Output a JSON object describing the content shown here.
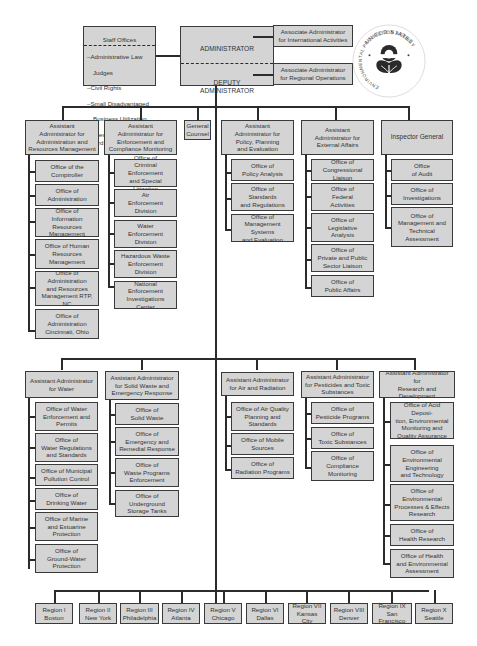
{
  "top": {
    "staff_offices": {
      "title": "Staff Offices",
      "items": [
        "–Administrative Law",
        "Judges",
        "–Civil Rights",
        "–Small Disadvantaged",
        "Business Utilization",
        "–Science Advisory Board"
      ]
    },
    "administrator": "ADMINISTRATOR",
    "deputy_administrator": "DEPUTY\nADMINISTRATOR",
    "assoc_international": "Associate Administrator\nfor International Activities",
    "assoc_regional": "Associate Administrator\nfor Regional Operations",
    "seal": {
      "top_text": "UNITED STATES",
      "side_text": "ENVIRONMENTAL PROTECTION AGENCY"
    }
  },
  "row1": {
    "arm": {
      "head": "Assistant\nAdministrator for\nAdministration and\nResources Management",
      "offices": [
        "Office of the\nComptroller",
        "Office of\nAdministration",
        "Office of\nInformation Resources\nManagement",
        "Office of Human\nResources\nManagement",
        "Office of\nAdministration\nand Resources\nManagement RTP, NC",
        "Office of\nAdministration\nCincinnati, Ohio"
      ]
    },
    "ecm": {
      "head": "Assistant\nAdministrator for\nEnforcement and\nCompliance Monitoring",
      "offices": [
        "Office of\nCriminal Enforcement\nand Special Litigation",
        "Air\nEnforcement\nDivision",
        "Water\nEnforcement\nDivision",
        "Hazardous Waste\nEnforcement\nDivision",
        "National\nEnforcement\nInvestigations Center"
      ]
    },
    "general_counsel": "General\nCounsel",
    "ppe": {
      "head": "Assistant\nAdministrator for\nPolicy, Planning\nand Evaluation",
      "offices": [
        "Office of\nPolicy Analysis",
        "Office of\nStandards\nand Regulations",
        "Office of\nManagement Systems\nand Evaluation"
      ]
    },
    "ea": {
      "head": "Assistant\nAdministrator for\nExternal Affairs",
      "offices": [
        "Office of\nCongressional Liaison",
        "Office of\nFederal\nActivities",
        "Office of\nLegislative\nAnalysis",
        "Office of\nPrivate and Public\nSector Liaison",
        "Office of\nPublic Affairs"
      ]
    },
    "ig": {
      "head": "Inspector General",
      "offices": [
        "Office\nof Audit",
        "Office of\nInvestigations",
        "Office of\nManagement and\nTechnical\nAssessment"
      ]
    }
  },
  "row2": {
    "water": {
      "head": "Assistant Administrator\nfor Water",
      "offices": [
        "Office of Water\nEnforcement and\nPermits",
        "Office of\nWater Regulations\nand Standards",
        "Office of Municipal\nPollution Control",
        "Office of\nDrinking Water",
        "Office of Marine\nand Estuarine\nProtection",
        "Office of\nGround-Water\nProtection"
      ]
    },
    "swer": {
      "head": "Assistant Administrator\nfor Solid Waste and\nEmergency Response",
      "offices": [
        "Office of\nSolid Waste",
        "Office of\nEmergency and\nRemedial Response",
        "Office of\nWaste Programs\nEnforcement",
        "Office of\nUnderground\nStorage Tanks"
      ]
    },
    "air": {
      "head": "Assistant Administrator\nfor Air and Radiation",
      "offices": [
        "Office of Air Quality\nPlanning and\nStandards",
        "Office of Mobile\nSources",
        "Office of\nRadiation Programs"
      ]
    },
    "pts": {
      "head": "Assistant Administrator\nfor Pesticides and Toxic\nSubstances",
      "offices": [
        "Office of\nPesticide Programs",
        "Office of\nToxic Substances",
        "Office of\nCompliance\nMonitoring"
      ]
    },
    "rd": {
      "head": "Assistant Administrator\nfor\nResearch and Development",
      "offices": [
        "Office of Acid Deposi-\ntion, Environmental\nMonitoring and\nQuality Assurance",
        "Office of\nEnvironmental\nEngineering\nand Technology",
        "Office of\nEnvironmental\nProcesses & Effects\nResearch",
        "Office of\nHealth Research",
        "Office of Health\nand Environmental\nAssessment"
      ]
    }
  },
  "regions": [
    "Region I\nBoston",
    "Region II\nNew York",
    "Region III\nPhiladelphia",
    "Region IV\nAtlanta",
    "Region V\nChicago",
    "Region VI\nDallas",
    "Region VII\nKansas City",
    "Region VIII\nDenver",
    "Region IX\nSan Francisco",
    "Region X\nSeattle"
  ],
  "colors": {
    "box_fill": "#d4d4d4",
    "line": "#2b2b2b",
    "text": "#333333"
  }
}
